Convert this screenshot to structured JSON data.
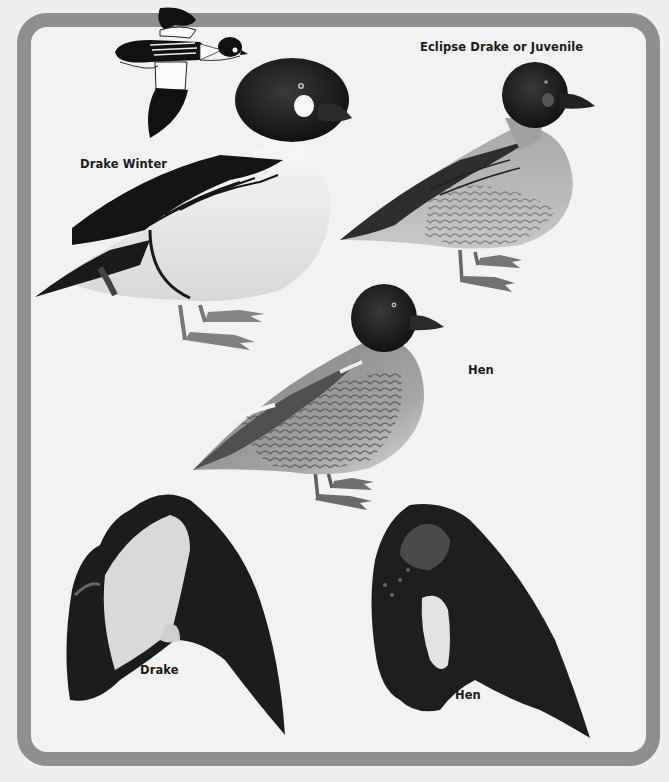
{
  "plate": {
    "frame_color": "#8f8f8f",
    "background_color": "#f2f2f2"
  },
  "figures": [
    {
      "id": "flight-silhouette",
      "label": ""
    },
    {
      "id": "drake-winter",
      "label": "Drake Winter"
    },
    {
      "id": "eclipse-drake",
      "label": "Eclipse Drake or Juvenile"
    },
    {
      "id": "hen",
      "label": "Hen"
    },
    {
      "id": "wing-drake",
      "label": "Drake"
    },
    {
      "id": "wing-hen",
      "label": "Hen"
    }
  ],
  "labels": {
    "eclipse": "Eclipse Drake or Juvenile",
    "drake_winter": "Drake Winter",
    "hen": "Hen",
    "wing_drake": "Drake",
    "wing_hen": "Hen"
  }
}
